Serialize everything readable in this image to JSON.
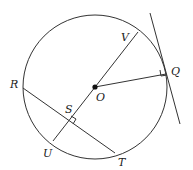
{
  "diagram": {
    "type": "geometry-circle",
    "circle": {
      "center": "O",
      "cx": 95,
      "cy": 87,
      "r": 72
    },
    "points": [
      {
        "name": "O",
        "x": 95,
        "y": 87,
        "label": "O",
        "lx": 96,
        "ly": 101
      },
      {
        "name": "V",
        "x": 138,
        "y": 32,
        "label": "V",
        "lx": 121,
        "ly": 41
      },
      {
        "name": "Q",
        "x": 166,
        "y": 74,
        "label": "Q",
        "lx": 171,
        "ly": 75
      },
      {
        "name": "R",
        "x": 23,
        "y": 88,
        "label": "R",
        "lx": 10,
        "ly": 88
      },
      {
        "name": "S",
        "x": 68,
        "y": 121,
        "label": "S",
        "lx": 65,
        "ly": 113
      },
      {
        "name": "U",
        "x": 53,
        "y": 141,
        "label": "U",
        "lx": 43,
        "ly": 157
      },
      {
        "name": "T",
        "x": 115,
        "y": 153,
        "label": "T",
        "lx": 118,
        "ly": 166
      }
    ],
    "segments": [
      {
        "name": "diameter-VU",
        "from": "V",
        "to": "U"
      },
      {
        "name": "radius-OQ",
        "from": "O",
        "to": "Q"
      },
      {
        "name": "chord-RT",
        "from": "R",
        "to": "T"
      },
      {
        "name": "tangent-line",
        "x1": 150,
        "y1": 13,
        "x2": 180,
        "y2": 124
      }
    ],
    "right_angles": [
      "at Q between OQ and tangent",
      "at S between RT and VU"
    ]
  }
}
